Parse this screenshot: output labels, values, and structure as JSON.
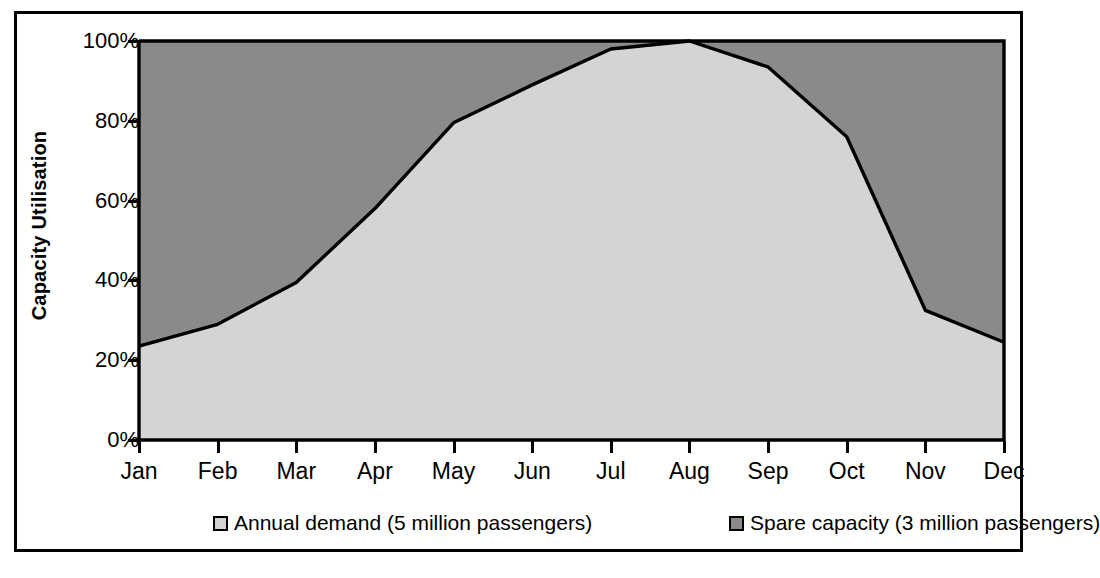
{
  "chart_data": {
    "type": "area",
    "title": "",
    "xlabel": "",
    "ylabel": "Capacity Utilisation",
    "categories": [
      "Jan",
      "Feb",
      "Mar",
      "Apr",
      "May",
      "Jun",
      "Jul",
      "Aug",
      "Sep",
      "Oct",
      "Nov",
      "Dec"
    ],
    "ylim": [
      0,
      100
    ],
    "ytick_labels": [
      "0%",
      "20%",
      "40%",
      "60%",
      "80%",
      "100%"
    ],
    "ytick_values": [
      0,
      20,
      40,
      60,
      80,
      100
    ],
    "grid": false,
    "legend_position": "bottom",
    "series": [
      {
        "name": "Annual demand (5 million passengers)",
        "color": "#d4d4d4",
        "values": [
          23.5,
          29,
          39.5,
          58,
          79.5,
          89,
          98,
          100,
          93.5,
          76,
          32.5,
          24.5
        ]
      },
      {
        "name": "Spare capacity (3 million passengers)",
        "color": "#8a8a8a",
        "values": [
          76.5,
          71,
          60.5,
          42,
          20.5,
          11,
          2,
          0,
          6.5,
          24,
          67.5,
          75.5
        ]
      }
    ]
  },
  "legend": {
    "items": [
      {
        "label": "Annual demand (5 million passengers)",
        "color": "#d4d4d4"
      },
      {
        "label": "Spare capacity (3 million passengers)",
        "color": "#8a8a8a"
      }
    ]
  },
  "axes": {
    "y_title": "Capacity Utilisation"
  },
  "colors": {
    "demand_fill": "#d4d4d4",
    "spare_fill": "#8a8a8a",
    "line": "#000000",
    "frame": "#000000",
    "background": "#ffffff"
  }
}
